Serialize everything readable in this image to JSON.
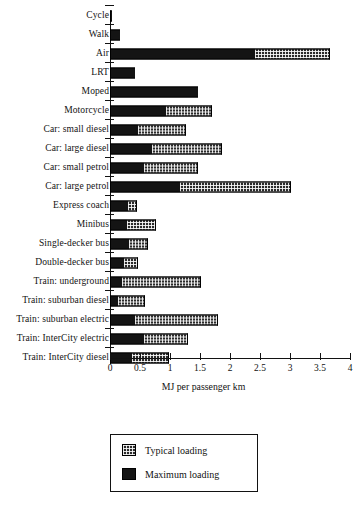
{
  "chart_data": {
    "type": "bar",
    "orientation": "horizontal",
    "stacked": true,
    "title": "",
    "xlabel": "MJ per passenger km",
    "ylabel": "",
    "xlim": [
      0,
      4
    ],
    "xticks": [
      "0",
      "0.5",
      "1",
      "1.5",
      "2",
      "2.5",
      "3",
      "3.5",
      "4"
    ],
    "xtick_values": [
      0,
      0.5,
      1,
      1.5,
      2,
      2.5,
      3,
      3.5,
      4
    ],
    "grid": false,
    "legend_position": "bottom-center",
    "categories": [
      "Cycle",
      "Walk",
      "Air",
      "LRT",
      "Moped",
      "Motorcycle",
      "Car: small diesel",
      "Car: large diesel",
      "Car: small petrol",
      "Car: large petrol",
      "Express coach",
      "Minibus",
      "Single-decker bus",
      "Double-decker bus",
      "Train: underground",
      "Train: suburban diesel",
      "Train: suburban electric",
      "Train: InterCity electric",
      "Train: InterCity diesel"
    ],
    "series": [
      {
        "name": "Maximum loading",
        "values": [
          0.03,
          0.17,
          2.42,
          0.41,
          1.47,
          0.93,
          0.46,
          0.7,
          0.56,
          1.16,
          0.3,
          0.28,
          0.32,
          0.24,
          0.2,
          0.13,
          0.41,
          0.56,
          0.37
        ]
      },
      {
        "name": "Typical loading",
        "values": [
          0.0,
          0.0,
          1.24,
          0.0,
          0.0,
          0.77,
          0.81,
          1.17,
          0.91,
          1.85,
          0.15,
          0.48,
          0.32,
          0.23,
          1.32,
          0.46,
          1.39,
          0.74,
          0.61
        ]
      }
    ],
    "totals": [
      0.03,
      0.17,
      3.66,
      0.41,
      1.47,
      1.7,
      1.27,
      1.87,
      1.47,
      3.01,
      0.45,
      0.76,
      0.64,
      0.47,
      1.52,
      0.59,
      1.8,
      1.3,
      0.98
    ]
  },
  "legend": {
    "items": [
      {
        "label": "Typical loading",
        "swatch": "hatched-dark"
      },
      {
        "label": "Maximum loading",
        "swatch": "solid-black"
      }
    ]
  },
  "footnote": "",
  "colors": {
    "axis": "#121212",
    "maximum_loading": "#141414",
    "typical_loading": "#2a2a2a",
    "background": "#ffffff"
  }
}
